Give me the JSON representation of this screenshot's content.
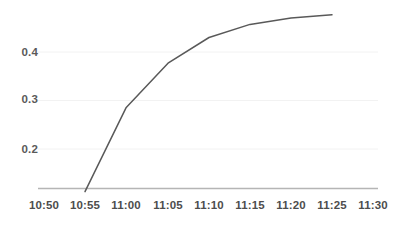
{
  "chart_data": {
    "type": "line",
    "title": "",
    "subtitle": "",
    "xlabel": "",
    "ylabel": "",
    "x": [
      "10:50",
      "10:55",
      "11:00",
      "11:05",
      "11:10",
      "11:15",
      "11:20",
      "11:25",
      "11:30"
    ],
    "xtick_labels": [
      "10:50",
      "10:55",
      "11:00",
      "11:05",
      "11:10",
      "11:15",
      "11:20",
      "11:25",
      "11:30"
    ],
    "ytick_labels": [
      "0.4",
      "0.3",
      "0.2"
    ],
    "ytick_values": [
      0.4,
      0.3,
      0.2
    ],
    "ylim": [
      0.11,
      0.49
    ],
    "xlim": [
      "10:50",
      "11:30"
    ],
    "grid": true,
    "grid_axis": "y",
    "legend": false,
    "legend_position": "none",
    "series": [
      {
        "name": "",
        "color": "#595959",
        "points": [
          {
            "x": "10:55",
            "y": 0.112
          },
          {
            "x": "11:00",
            "y": 0.285
          },
          {
            "x": "11:05",
            "y": 0.377
          },
          {
            "x": "11:10",
            "y": 0.43
          },
          {
            "x": "11:15",
            "y": 0.457
          },
          {
            "x": "11:20",
            "y": 0.47
          },
          {
            "x": "11:25",
            "y": 0.477
          }
        ],
        "values": [
          null,
          0.112,
          0.285,
          0.377,
          0.43,
          0.457,
          0.47,
          0.477,
          null
        ]
      }
    ],
    "colors": {
      "line": "#595959",
      "axis": "#b3b3b3",
      "grid": "#f2f2f2",
      "tick_label": "#4d4d4d",
      "background": "#ffffff"
    }
  },
  "axes": {
    "y_ticks": [
      {
        "label": "0.4",
        "top": 46
      },
      {
        "label": "0.3",
        "top": 93
      },
      {
        "label": "0.2",
        "top": 143
      }
    ],
    "x_ticks": [
      {
        "label": "10:50",
        "left": 23
      },
      {
        "label": "10:55",
        "left": 64
      },
      {
        "label": "11:00",
        "left": 105
      },
      {
        "label": "11:05",
        "left": 147
      },
      {
        "label": "11:10",
        "left": 188
      },
      {
        "label": "11:15",
        "left": 229
      },
      {
        "label": "11:20",
        "left": 270
      },
      {
        "label": "11:25",
        "left": 311
      },
      {
        "label": "11:30",
        "left": 352
      }
    ]
  }
}
